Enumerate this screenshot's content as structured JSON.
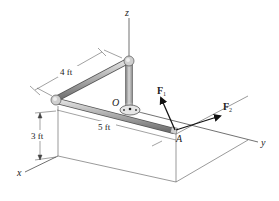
{
  "diagram": {
    "type": "3D statics pipe assembly",
    "axes": {
      "x": "x",
      "y": "y",
      "z": "z"
    },
    "points": {
      "origin": "O",
      "end": "A"
    },
    "forces": [
      {
        "symbol": "F",
        "subscript": "1"
      },
      {
        "symbol": "F",
        "subscript": "2"
      }
    ],
    "dimensions": {
      "pipe_diagonal": "4 ft",
      "pipe_along": "5 ft",
      "height": "3 ft"
    },
    "colors": {
      "pipe": "#9a9a9a",
      "pipe_highlight": "#d8d8d8",
      "lines": "#333333",
      "arrow": "#111111"
    }
  }
}
